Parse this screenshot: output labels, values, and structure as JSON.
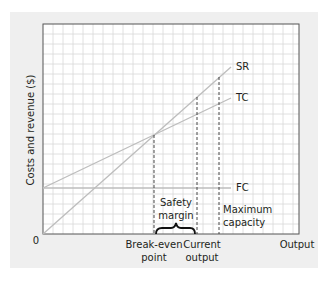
{
  "chart_data": {
    "type": "line",
    "title": "",
    "xlabel": "Output",
    "ylabel": "Costs and revenue ($)",
    "origin_label": "0",
    "grid": true,
    "xlim": [
      0,
      25.6
    ],
    "ylim": [
      0,
      21
    ],
    "series": [
      {
        "name": "SR",
        "label": "SR",
        "points": [
          [
            0,
            0
          ],
          [
            18.8,
            16.7
          ]
        ],
        "color": "#bdbdbd"
      },
      {
        "name": "TC",
        "label": "TC",
        "points": [
          [
            0,
            4.6
          ],
          [
            18.8,
            13.6
          ]
        ],
        "color": "#bdbdbd"
      },
      {
        "name": "FC",
        "label": "FC",
        "points": [
          [
            0,
            4.6
          ],
          [
            18.8,
            4.6
          ]
        ],
        "color": "#bdbdbd"
      }
    ],
    "markers": [
      {
        "name": "break-even",
        "label": "Break-even point",
        "x": 11.1,
        "y": 10.0,
        "style": "dashed"
      },
      {
        "name": "current-output",
        "label": "Current output",
        "x": 15.4,
        "y": 13.7,
        "style": "dashed"
      },
      {
        "name": "maximum-capacity",
        "label": "Maximum capacity",
        "x": 17.6,
        "y": 15.6,
        "style": "dashed"
      }
    ],
    "annotations": [
      {
        "name": "safety-margin",
        "label": "Safety margin",
        "from_x": 11.1,
        "to_x": 15.4,
        "type": "brace"
      }
    ]
  },
  "labels": {
    "y_axis": "Costs and revenue ($)",
    "x_axis": "Output",
    "origin": "0",
    "sr": "SR",
    "tc": "TC",
    "fc": "FC",
    "break_even_1": "Break-even",
    "break_even_2": "point",
    "current_1": "Current",
    "current_2": "output",
    "safety_1": "Safety",
    "safety_2": "margin",
    "max_1": "Maximum",
    "max_2": "capacity"
  },
  "colors": {
    "panel": "#efefef",
    "grid": "#d8d8d8",
    "frame": "#555555",
    "lines": "#bdbdbd",
    "text": "#231f20"
  }
}
